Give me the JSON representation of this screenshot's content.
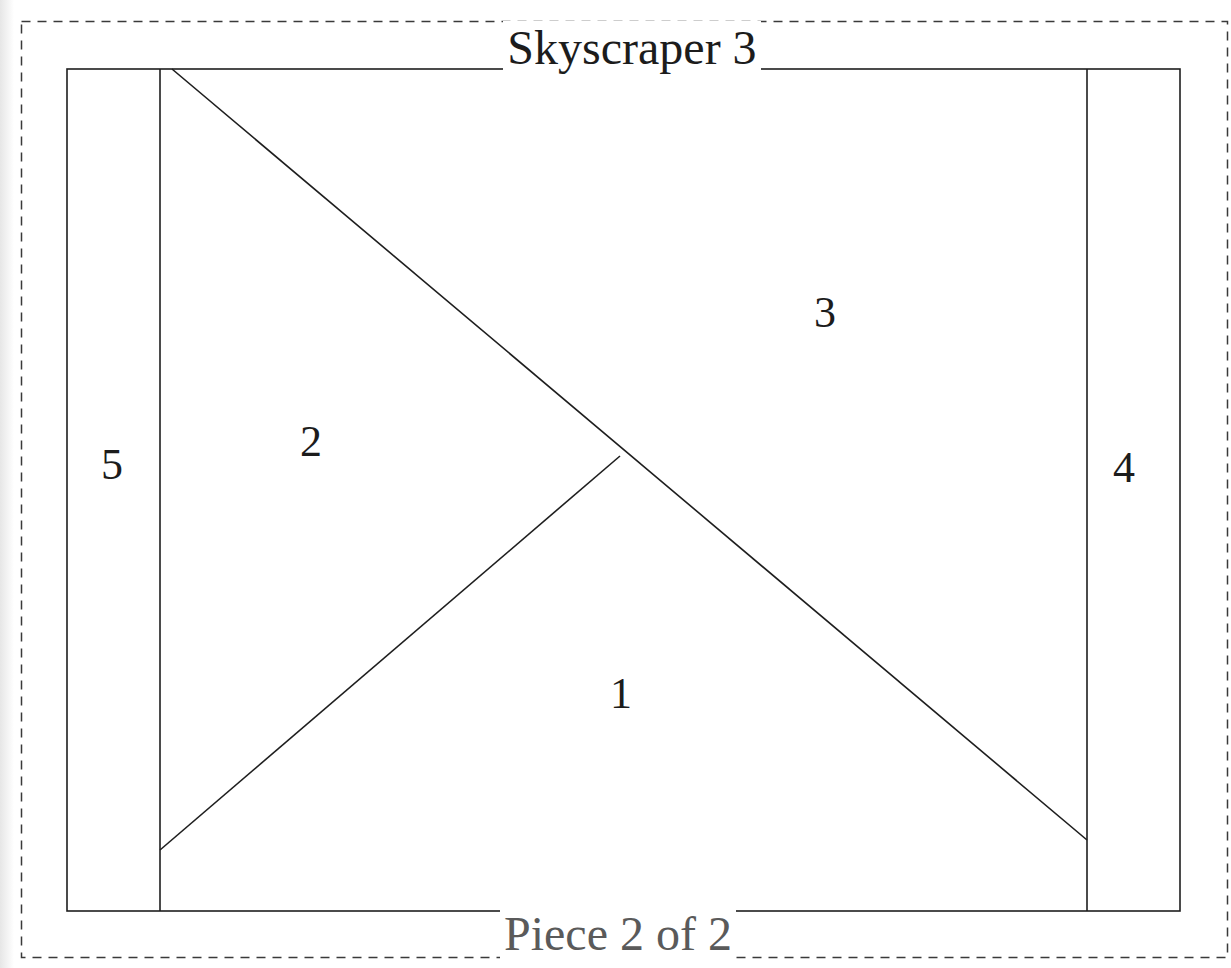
{
  "pattern": {
    "title": "Skyscraper 3",
    "footer": "Piece 2 of 2",
    "line_color": "#1e1e1e",
    "border_color": "#3a3a3a",
    "pieces": [
      {
        "number": "1",
        "label": "1"
      },
      {
        "number": "2",
        "label": "2"
      },
      {
        "number": "3",
        "label": "3"
      },
      {
        "number": "4",
        "label": "4"
      },
      {
        "number": "5",
        "label": "5"
      }
    ]
  }
}
